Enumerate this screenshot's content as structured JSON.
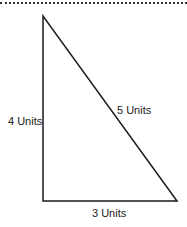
{
  "diagram": {
    "type": "right-triangle",
    "line_color": "#1a1a1a",
    "sides": {
      "vertical": {
        "label": "4 Units",
        "length": 4
      },
      "hypotenuse": {
        "label": "5 Units",
        "length": 5
      },
      "horizontal": {
        "label": "3 Units",
        "length": 3
      }
    }
  }
}
